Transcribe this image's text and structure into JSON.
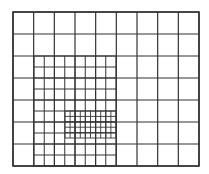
{
  "diagram": {
    "type": "adaptive-mesh-refinement-grid",
    "line_color": "#333333",
    "background": "#ffffff",
    "coarse": {
      "x0": 13,
      "y0": 12,
      "x1": 199,
      "y1": 166,
      "cols": 9,
      "rows": 7,
      "stroke": 1.2
    },
    "medium": {
      "x0": 34,
      "y0": 56,
      "x1": 116,
      "y1": 166,
      "cols": 8,
      "rows": 10,
      "stroke": 1.0
    },
    "fine": {
      "x0": 65,
      "y0": 111,
      "x1": 116,
      "y1": 138,
      "cols": 10,
      "rows": 5,
      "stroke": 0.9
    },
    "border_stroke": 1.6
  }
}
